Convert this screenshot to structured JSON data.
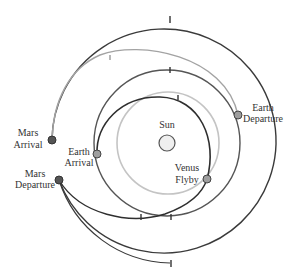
{
  "diagram": {
    "colors": {
      "dark_orbit": "#3a3a3a",
      "mid_orbit": "#555555",
      "light_orbit": "#bdbdbd",
      "light_arc": "#9a9a9a",
      "node_fill_dark": "#555555",
      "node_fill_light": "#9e9e9e",
      "sun_fill": "#efefef"
    },
    "labels": {
      "sun": "Sun",
      "earth_departure_1": "Earth",
      "earth_departure_2": "Departure",
      "mars_arrival_1": "Mars",
      "mars_arrival_2": "Arrival",
      "earth_arrival_1": "Earth",
      "earth_arrival_2": "Arrival",
      "mars_departure_1": "Mars",
      "mars_departure_2": "Departure",
      "venus_flyby_1": "Venus",
      "venus_flyby_2": "Flyby"
    },
    "nodes": [
      {
        "name": "Earth Departure",
        "x": 238,
        "y": 115
      },
      {
        "name": "Mars Arrival",
        "x": 52,
        "y": 140
      },
      {
        "name": "Earth Arrival",
        "x": 97,
        "y": 154
      },
      {
        "name": "Mars Departure",
        "x": 59,
        "y": 180
      },
      {
        "name": "Venus Flyby",
        "x": 207,
        "y": 179
      }
    ]
  }
}
